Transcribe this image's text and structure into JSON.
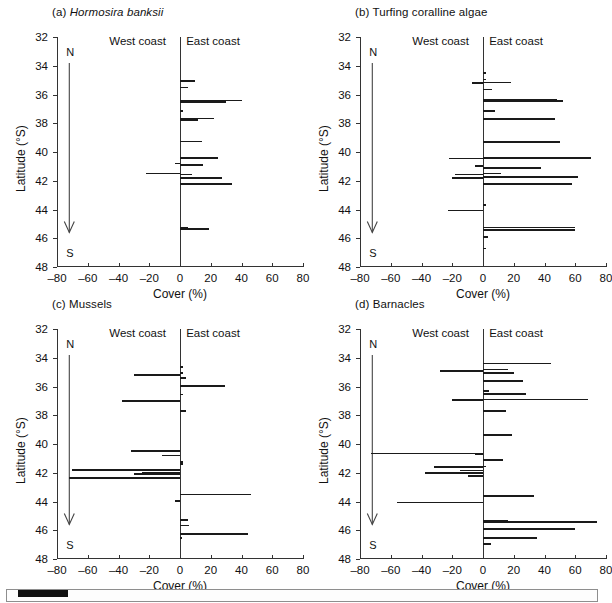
{
  "figure": {
    "axis_title_y": "Latitude (°S)",
    "axis_title_x": "Cover (%)",
    "coast_west_label": "West coast",
    "coast_east_label": "East coast",
    "north_letter": "N",
    "south_letter": "S",
    "y_ticks": [
      32,
      34,
      36,
      38,
      40,
      42,
      44,
      46,
      48
    ],
    "y_tick_labels": [
      "32",
      "34",
      "36",
      "38",
      "40",
      "42",
      "44",
      "46",
      "48"
    ],
    "x_ticks": [
      -80,
      -60,
      -40,
      -20,
      0,
      20,
      40,
      60,
      80
    ],
    "x_tick_labels": [
      "–80",
      "–60",
      "–40",
      "–20",
      "0",
      "20",
      "40",
      "60",
      "80"
    ],
    "ylim": [
      32,
      48
    ],
    "xlim": [
      -80,
      80
    ],
    "arrow_latitude_start": 33.8,
    "arrow_latitude_end": 45.6,
    "line_color": "#1a1a1a"
  },
  "panels": [
    {
      "id": "a",
      "tag": "(a)",
      "name": "Hormosira banksii",
      "italic_name": true,
      "title": "(a) Hormosira banksii"
    },
    {
      "id": "b",
      "tag": "(b)",
      "name": "Turfing coralline algae",
      "italic_name": false,
      "title": "(b) Turfing coralline algae"
    },
    {
      "id": "c",
      "tag": "(c)",
      "name": "Mussels",
      "italic_name": false,
      "title": "(c) Mussels"
    },
    {
      "id": "d",
      "tag": "(d)",
      "name": "Barnacles",
      "italic_name": false,
      "title": "(d) Barnacles"
    }
  ],
  "chart_data": [
    {
      "type": "bar",
      "orientation": "horizontal",
      "panel": "a",
      "title": "(a) Hormosira banksii",
      "xlabel": "Cover (%)",
      "ylabel": "Latitude (°S)",
      "xlim": [
        -80,
        80
      ],
      "ylim": [
        32,
        48
      ],
      "grid": false,
      "legend": null,
      "note": "Negative Cover (%) = West coast sites, positive = East coast sites",
      "bars": [
        {
          "lat": 35.0,
          "value": 10
        },
        {
          "lat": 35.45,
          "value": 5
        },
        {
          "lat": 36.35,
          "value": 40
        },
        {
          "lat": 36.45,
          "value": 30
        },
        {
          "lat": 37.1,
          "value": 2
        },
        {
          "lat": 37.6,
          "value": 22
        },
        {
          "lat": 37.7,
          "value": 12
        },
        {
          "lat": 39.2,
          "value": 14
        },
        {
          "lat": 40.35,
          "value": 25
        },
        {
          "lat": 40.75,
          "value": -3
        },
        {
          "lat": 40.85,
          "value": 15
        },
        {
          "lat": 41.45,
          "value": -22
        },
        {
          "lat": 41.5,
          "value": 8
        },
        {
          "lat": 41.75,
          "value": 27
        },
        {
          "lat": 42.15,
          "value": 34
        },
        {
          "lat": 45.2,
          "value": 5
        },
        {
          "lat": 45.3,
          "value": 19
        }
      ]
    },
    {
      "type": "bar",
      "orientation": "horizontal",
      "panel": "b",
      "title": "(b) Turfing coralline algae",
      "xlabel": "Cover (%)",
      "ylabel": "Latitude (°S)",
      "xlim": [
        -80,
        80
      ],
      "ylim": [
        32,
        48
      ],
      "grid": false,
      "legend": null,
      "note": "Negative Cover (%) = West coast sites, positive = East coast sites",
      "bars": [
        {
          "lat": 34.45,
          "value": 2
        },
        {
          "lat": 34.9,
          "value": 2
        },
        {
          "lat": 35.1,
          "value": 18
        },
        {
          "lat": 35.15,
          "value": -7
        },
        {
          "lat": 35.6,
          "value": 6
        },
        {
          "lat": 36.3,
          "value": 48
        },
        {
          "lat": 36.4,
          "value": 52
        },
        {
          "lat": 37.1,
          "value": 8
        },
        {
          "lat": 37.6,
          "value": 33
        },
        {
          "lat": 37.65,
          "value": 47
        },
        {
          "lat": 39.25,
          "value": 50
        },
        {
          "lat": 40.35,
          "value": 70
        },
        {
          "lat": 40.4,
          "value": -22
        },
        {
          "lat": 40.9,
          "value": -5
        },
        {
          "lat": 41.05,
          "value": 38
        },
        {
          "lat": 41.45,
          "value": 12
        },
        {
          "lat": 41.5,
          "value": -18
        },
        {
          "lat": 41.7,
          "value": 62
        },
        {
          "lat": 41.75,
          "value": -20
        },
        {
          "lat": 42.15,
          "value": 58
        },
        {
          "lat": 43.65,
          "value": 2
        },
        {
          "lat": 44.0,
          "value": -23
        },
        {
          "lat": 45.2,
          "value": 60
        },
        {
          "lat": 45.35,
          "value": 60
        },
        {
          "lat": 45.85,
          "value": 3
        },
        {
          "lat": 46.65,
          "value": 2
        }
      ]
    },
    {
      "type": "bar",
      "orientation": "horizontal",
      "panel": "c",
      "title": "(c) Mussels",
      "xlabel": "Cover (%)",
      "ylabel": "Latitude (°S)",
      "xlim": [
        -80,
        80
      ],
      "ylim": [
        32,
        48
      ],
      "grid": false,
      "legend": null,
      "note": "Negative Cover (%) = West coast sites, positive = East coast sites",
      "bars": [
        {
          "lat": 34.6,
          "value": 2
        },
        {
          "lat": 35.0,
          "value": 2
        },
        {
          "lat": 35.15,
          "value": -30
        },
        {
          "lat": 35.35,
          "value": 4
        },
        {
          "lat": 35.9,
          "value": 29
        },
        {
          "lat": 36.5,
          "value": 2
        },
        {
          "lat": 36.95,
          "value": -38
        },
        {
          "lat": 37.65,
          "value": 4
        },
        {
          "lat": 40.45,
          "value": -32
        },
        {
          "lat": 40.75,
          "value": -12
        },
        {
          "lat": 41.2,
          "value": 2
        },
        {
          "lat": 41.35,
          "value": 2
        },
        {
          "lat": 41.75,
          "value": -70
        },
        {
          "lat": 41.95,
          "value": -25
        },
        {
          "lat": 42.05,
          "value": -30
        },
        {
          "lat": 42.3,
          "value": -72
        },
        {
          "lat": 43.45,
          "value": 46
        },
        {
          "lat": 43.9,
          "value": -3
        },
        {
          "lat": 45.25,
          "value": 5
        },
        {
          "lat": 45.6,
          "value": 6
        },
        {
          "lat": 46.2,
          "value": 44
        },
        {
          "lat": 46.5,
          "value": 1
        }
      ]
    },
    {
      "type": "bar",
      "orientation": "horizontal",
      "panel": "d",
      "title": "(d) Barnacles",
      "xlabel": "Cover (%)",
      "ylabel": "Latitude (°S)",
      "xlim": [
        -80,
        80
      ],
      "ylim": [
        32,
        48
      ],
      "grid": false,
      "legend": null,
      "note": "Negative Cover (%) = West coast sites, positive = East coast sites",
      "bars": [
        {
          "lat": 34.35,
          "value": 44
        },
        {
          "lat": 34.75,
          "value": 16
        },
        {
          "lat": 34.85,
          "value": -28
        },
        {
          "lat": 35.0,
          "value": 20
        },
        {
          "lat": 35.55,
          "value": 26
        },
        {
          "lat": 36.25,
          "value": 4
        },
        {
          "lat": 36.45,
          "value": 28
        },
        {
          "lat": 36.85,
          "value": 68
        },
        {
          "lat": 36.9,
          "value": -20
        },
        {
          "lat": 37.65,
          "value": 15
        },
        {
          "lat": 39.3,
          "value": 19
        },
        {
          "lat": 40.6,
          "value": -73
        },
        {
          "lat": 40.65,
          "value": -5
        },
        {
          "lat": 41.05,
          "value": 13
        },
        {
          "lat": 41.5,
          "value": 2
        },
        {
          "lat": 41.55,
          "value": -32
        },
        {
          "lat": 41.8,
          "value": -15
        },
        {
          "lat": 41.95,
          "value": -38
        },
        {
          "lat": 42.15,
          "value": -10
        },
        {
          "lat": 43.55,
          "value": 33
        },
        {
          "lat": 44.0,
          "value": -56
        },
        {
          "lat": 45.3,
          "value": 16
        },
        {
          "lat": 45.35,
          "value": 74
        },
        {
          "lat": 45.85,
          "value": 60
        },
        {
          "lat": 46.5,
          "value": 35
        },
        {
          "lat": 46.9,
          "value": 5
        }
      ]
    }
  ]
}
